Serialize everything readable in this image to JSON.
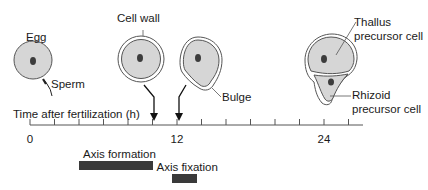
{
  "labels": {
    "egg": "Egg",
    "sperm": "Sperm",
    "cell_wall": "Cell wall",
    "bulge": "Bulge",
    "thallus": "Thallus\nprecursor cell",
    "thallus_line1": "Thallus",
    "thallus_line2": "precursor cell",
    "rhizoid_line1": "Rhizoid",
    "rhizoid_line2": "precursor cell",
    "axis_title": "Time after fertilization (h)"
  },
  "timeline": {
    "unit": "h",
    "min": 0,
    "max": 28,
    "tick_interval": 2,
    "tick_labels": [
      {
        "value": 0,
        "label": "0"
      },
      {
        "value": 12,
        "label": "12"
      },
      {
        "value": 24,
        "label": "24"
      }
    ],
    "arrows_at": [
      10,
      12
    ]
  },
  "phases": [
    {
      "name": "Axis formation",
      "start": 4,
      "end": 10
    },
    {
      "name": "Axis fixation",
      "start": 11.6,
      "end": 13.6
    }
  ],
  "colors": {
    "cell_fill": "#d6d6d6",
    "nucleus": "#3c3c3c",
    "outline": "#3a3a3a",
    "bar": "#3a3a3a"
  }
}
